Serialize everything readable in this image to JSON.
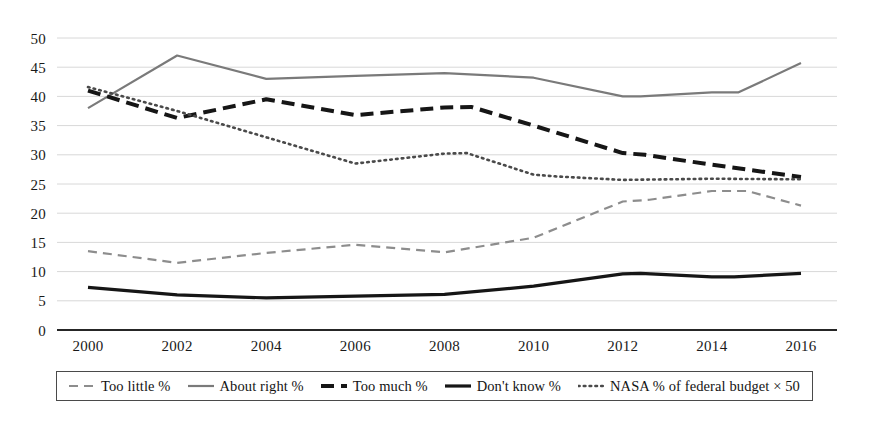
{
  "chart_data": {
    "type": "line",
    "title": "",
    "xlabel": "",
    "ylabel": "",
    "x": [
      2000,
      2002,
      2004,
      2006,
      2008,
      2010,
      2012,
      2014,
      2016
    ],
    "x_ticks": [
      "2000",
      "2002",
      "2004",
      "2006",
      "2008",
      "2010",
      "2012",
      "2014",
      "2016"
    ],
    "y_ticks": [
      "0",
      "5",
      "10",
      "15",
      "20",
      "25",
      "30",
      "35",
      "40",
      "45",
      "50"
    ],
    "ylim": [
      0,
      50
    ],
    "xlim": [
      2000,
      2016
    ],
    "grid": true,
    "legend_position": "bottom",
    "series": [
      {
        "name": "Too little %",
        "style": "dashed",
        "color": "#8d8d8d",
        "width": 2.2,
        "values": [
          13.5,
          11.5,
          13.2,
          14.6,
          13.3,
          15.8,
          22.0,
          23.8,
          21.3
        ]
      },
      {
        "name": "About right %",
        "style": "solid",
        "color": "#7a7a7a",
        "width": 2.2,
        "values": [
          38.0,
          47.0,
          43.0,
          43.5,
          44.0,
          43.2,
          40.0,
          40.7,
          45.7
        ]
      },
      {
        "name": "Too much %",
        "style": "dashed",
        "color": "#161616",
        "width": 4.0,
        "values": [
          41.0,
          36.3,
          39.5,
          36.8,
          38.1,
          35.0,
          30.3,
          28.3,
          26.2
        ]
      },
      {
        "name": "Don't know %",
        "style": "solid",
        "color": "#161616",
        "width": 3.2,
        "values": [
          7.3,
          6.0,
          5.5,
          5.8,
          6.1,
          7.5,
          9.6,
          9.1,
          9.7
        ]
      },
      {
        "name": "NASA % of federal budget × 50",
        "style": "dotted",
        "color": "#4a4a4a",
        "width": 2.6,
        "values": [
          41.6,
          37.5,
          33.0,
          28.5,
          30.2,
          26.6,
          25.7,
          25.9,
          25.8
        ]
      }
    ],
    "extra_points": {
      "Too little %": [
        [
          2012.6,
          22.3
        ],
        [
          2014.8,
          23.8
        ]
      ],
      "About right %": [
        [
          2012.4,
          40.0
        ],
        [
          2014.6,
          40.7
        ]
      ],
      "Too much %": [
        [
          2008.6,
          38.2
        ],
        [
          2012.5,
          30.0
        ]
      ],
      "Don't know %": [
        [
          2012.4,
          9.7
        ],
        [
          2014.5,
          9.1
        ]
      ],
      "NASA % of federal budget × 50": [
        [
          2008.5,
          30.3
        ],
        [
          2010.5,
          26.3
        ]
      ]
    }
  },
  "legend": {
    "items": [
      {
        "label": "Too little %",
        "swatch": "dashed-gray-icon"
      },
      {
        "label": "About right %",
        "swatch": "solid-gray-icon"
      },
      {
        "label": "Too much %",
        "swatch": "dashed-black-icon"
      },
      {
        "label": "Don't know %",
        "swatch": "solid-black-icon"
      },
      {
        "label": "NASA % of federal budget × 50",
        "swatch": "dotted-gray-icon"
      }
    ]
  },
  "axes": {
    "y_axis_label": "",
    "x_axis_label": ""
  },
  "colors": {
    "gridline": "#d8d8d8",
    "axis": "#262626",
    "text": "#191919"
  }
}
